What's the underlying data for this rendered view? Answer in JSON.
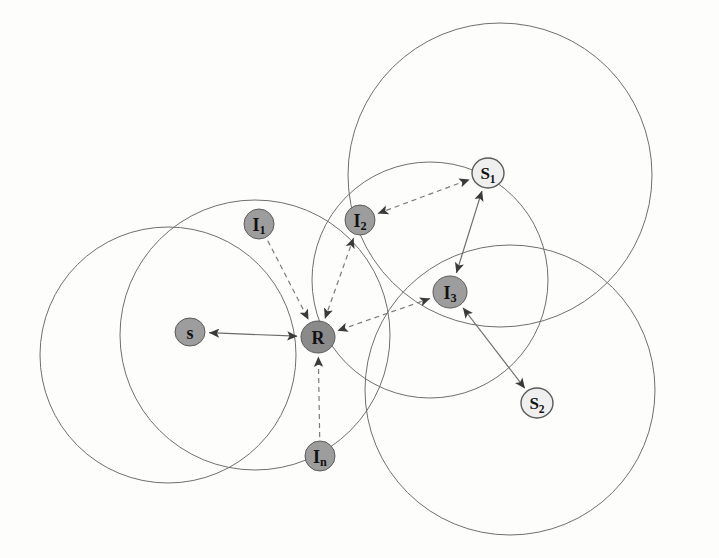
{
  "figure": {
    "kind": "network-topology-diagram",
    "background_color": "#fdfdfb",
    "canvas": {
      "width": 719,
      "height": 558
    },
    "palette": {
      "circle_stroke": "#6f6f6f",
      "edge_solid": "#6b6b6b",
      "edge_dashed": "#7a7a7a",
      "arrowhead": "#3a3a3a",
      "node_gray_fill": "#9d9d9d",
      "node_dark_fill": "#8a8a8a",
      "node_white_fill": "#efefef",
      "node_stroke": "#5a5a5a",
      "label_color": "#111111"
    }
  },
  "coverage_circles": [
    {
      "name": "circle-left-outer",
      "cx": 168,
      "cy": 355,
      "r": 128
    },
    {
      "name": "circle-left-inner",
      "cx": 255,
      "cy": 335,
      "r": 135
    },
    {
      "name": "circle-top-right",
      "cx": 500,
      "cy": 175,
      "r": 152
    },
    {
      "name": "circle-center-right",
      "cx": 430,
      "cy": 280,
      "r": 118
    },
    {
      "name": "circle-bottom-right",
      "cx": 510,
      "cy": 390,
      "r": 145
    }
  ],
  "nodes": [
    {
      "id": "s",
      "label": "s",
      "sub": "",
      "cx": 190,
      "cy": 332,
      "rx": 15,
      "ry": 14,
      "style": "gray"
    },
    {
      "id": "R",
      "label": "R",
      "sub": "",
      "cx": 318,
      "cy": 337,
      "rx": 17,
      "ry": 16,
      "style": "dark"
    },
    {
      "id": "I1",
      "label": "I",
      "sub": "1",
      "cx": 259,
      "cy": 224,
      "rx": 15,
      "ry": 15,
      "style": "gray"
    },
    {
      "id": "I2",
      "label": "I",
      "sub": "2",
      "cx": 360,
      "cy": 220,
      "rx": 15,
      "ry": 15,
      "style": "gray"
    },
    {
      "id": "I3",
      "label": "I",
      "sub": "3",
      "cx": 450,
      "cy": 292,
      "rx": 17,
      "ry": 16,
      "style": "gray"
    },
    {
      "id": "In",
      "label": "I",
      "sub": "n",
      "cx": 320,
      "cy": 456,
      "rx": 15,
      "ry": 15,
      "style": "gray"
    },
    {
      "id": "S1",
      "label": "S",
      "sub": "1",
      "cx": 488,
      "cy": 173,
      "rx": 16,
      "ry": 15,
      "style": "white"
    },
    {
      "id": "S2",
      "label": "S",
      "sub": "2",
      "cx": 537,
      "cy": 403,
      "rx": 16,
      "ry": 15,
      "style": "white"
    }
  ],
  "edges": [
    {
      "name": "edge-s-R",
      "from": "s",
      "to": "R",
      "line": "solid",
      "arrows": "both"
    },
    {
      "name": "edge-I1-R",
      "from": "I1",
      "to": "R",
      "line": "dashed",
      "arrows": "to"
    },
    {
      "name": "edge-I2-R",
      "from": "I2",
      "to": "R",
      "line": "dashed",
      "arrows": "both"
    },
    {
      "name": "edge-In-R",
      "from": "In",
      "to": "R",
      "line": "dashed",
      "arrows": "to"
    },
    {
      "name": "edge-I3-R",
      "from": "I3",
      "to": "R",
      "line": "dashed",
      "arrows": "both"
    },
    {
      "name": "edge-I2-S1",
      "from": "I2",
      "to": "S1",
      "line": "dashed",
      "arrows": "both"
    },
    {
      "name": "edge-I3-S1",
      "from": "I3",
      "to": "S1",
      "line": "solid",
      "arrows": "both"
    },
    {
      "name": "edge-I3-S2",
      "from": "I3",
      "to": "S2",
      "line": "solid",
      "arrows": "both"
    }
  ]
}
